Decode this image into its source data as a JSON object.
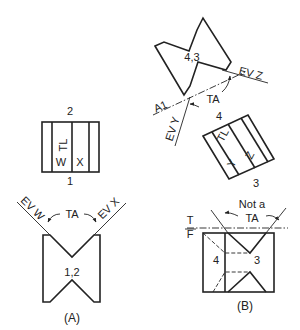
{
  "figure_a": {
    "caption": "(A)",
    "top_view_labels": {
      "top": "2",
      "bottom": "1",
      "true_length": "TL",
      "face_w": "W",
      "face_x": "X"
    },
    "front_view_label": "1,2",
    "edge_view_w": "EV W",
    "edge_view_x": "EV X",
    "true_angle": "TA"
  },
  "figure_b": {
    "caption": "(B)",
    "aux_view_label": "4,3",
    "edge_view_z": "EV Z",
    "edge_view_y": "EV Y",
    "true_angle": "TA",
    "fold_line_a1": "A1",
    "fold_line_a1_sub": "T",
    "aux_top_labels": {
      "top": "4",
      "bottom": "3",
      "true_length": "TL",
      "face_y": "Y",
      "face_z": "Z"
    },
    "not_true_angle_line1": "Not a",
    "not_true_angle_line2": "TA",
    "fold_t": "T",
    "fold_f": "F",
    "front_label_left": "4",
    "front_label_right": "3"
  }
}
